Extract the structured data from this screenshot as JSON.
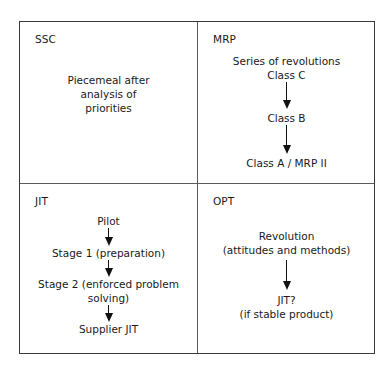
{
  "diagram": {
    "quadrants": [
      {
        "title": "SSC",
        "steps": [
          {
            "lines": [
              "Piecemeal after",
              "analysis of",
              "priorities"
            ]
          }
        ]
      },
      {
        "title": "MRP",
        "steps": [
          {
            "lines": [
              "Series of revolutions",
              "Class C"
            ]
          },
          {
            "lines": [
              "Class B"
            ]
          },
          {
            "lines": [
              "Class A / MRP II"
            ]
          }
        ]
      },
      {
        "title": "JIT",
        "steps": [
          {
            "lines": [
              "Pilot"
            ]
          },
          {
            "lines": [
              "Stage 1 (preparation)"
            ]
          },
          {
            "lines": [
              "Stage 2 (enforced problem",
              "solving)"
            ]
          },
          {
            "lines": [
              "Supplier JIT"
            ]
          }
        ]
      },
      {
        "title": "OPT",
        "steps": [
          {
            "lines": [
              "Revolution",
              "(attitudes and methods)"
            ]
          },
          {
            "lines": [
              "JIT?",
              "(if stable product)"
            ]
          }
        ]
      }
    ]
  }
}
